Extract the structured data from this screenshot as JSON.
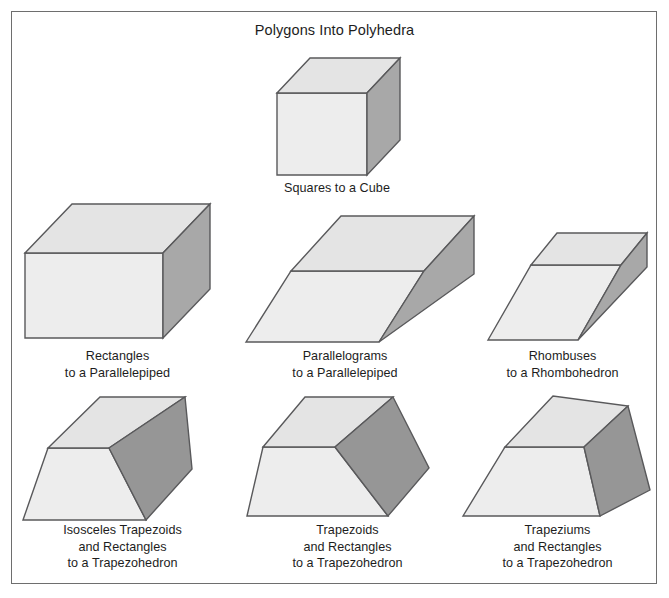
{
  "figure": {
    "title": "Polygons Into Polyhedra",
    "background_color": "#ffffff",
    "frame_color": "#6e6e6e",
    "text_color": "#1d1d1d"
  },
  "palette": {
    "face_front": "#ededed",
    "face_top": "#e4e4e4",
    "face_right_dark": "#a8a8a8",
    "face_right_darker": "#969696",
    "edge": "#59595b",
    "edge_inner": "#6b6b6d"
  },
  "items": [
    {
      "id": "cube",
      "name": "squares-to-a-cube",
      "caption": "Squares to a Cube",
      "solid": "cube",
      "faces": [
        "squares"
      ],
      "result": "Cube"
    },
    {
      "id": "parallelepiped-rect",
      "name": "rectangles-to-a-parallelepiped",
      "caption": "Rectangles\nto a Parallelepiped",
      "solid": "parallelepiped",
      "faces": [
        "rectangles"
      ],
      "result": "Parallelepiped"
    },
    {
      "id": "parallelepiped-parallelogram",
      "name": "parallelograms-to-a-parallelepiped",
      "caption": "Parallelograms\nto a Parallelepiped",
      "solid": "oblique parallelepiped",
      "faces": [
        "parallelograms"
      ],
      "result": "Parallelepiped"
    },
    {
      "id": "rhombohedron",
      "name": "rhombuses-to-a-rhombohedron",
      "caption": "Rhombuses\nto a Rhombohedron",
      "solid": "rhombohedron",
      "faces": [
        "rhombuses"
      ],
      "result": "Rhombohedron"
    },
    {
      "id": "trapezohedron-isosceles",
      "name": "isosceles-trapezoids-and-rectangles-to-a-trapezohedron",
      "caption": "Isosceles Trapezoids\nand Rectangles\nto a Trapezohedron",
      "solid": "trapezohedron",
      "faces": [
        "isosceles trapezoids",
        "rectangles"
      ],
      "result": "Trapezohedron"
    },
    {
      "id": "trapezohedron-trapezoids",
      "name": "trapezoids-and-rectangles-to-a-trapezohedron",
      "caption": "Trapezoids\nand Rectangles\nto a Trapezohedron",
      "solid": "trapezohedron",
      "faces": [
        "trapezoids",
        "rectangles"
      ],
      "result": "Trapezohedron"
    },
    {
      "id": "trapezohedron-trapeziums",
      "name": "trapeziums-and-rectangles-to-a-trapezohedron",
      "caption": "Trapeziums\nand Rectangles\nto a Trapezohedron",
      "solid": "trapezohedron",
      "faces": [
        "trapeziums",
        "rectangles"
      ],
      "result": "Trapezohedron"
    }
  ]
}
